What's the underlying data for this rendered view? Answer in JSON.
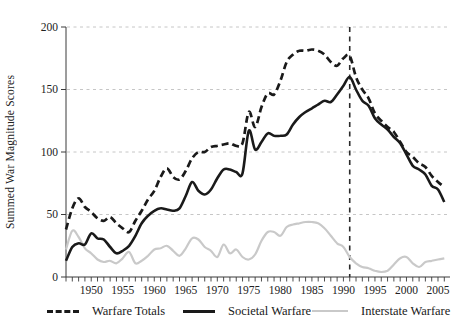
{
  "figure": {
    "ylabel": "Summed War Magnitude Scores"
  },
  "chart_data": {
    "type": "line",
    "title": "",
    "xlabel": "",
    "ylabel": "Summed War Magnitude Scores",
    "xlim": [
      1946,
      2007
    ],
    "ylim": [
      0,
      200
    ],
    "yticks": [
      0,
      50,
      100,
      150,
      200
    ],
    "xticks": [
      1950,
      1955,
      1960,
      1965,
      1970,
      1975,
      1980,
      1985,
      1990,
      1995,
      2000,
      2005
    ],
    "grid": "horizontal-dashed",
    "gridline_values": [
      50,
      100,
      150,
      200
    ],
    "vline_year": 1991,
    "legend_position": "bottom",
    "x": [
      1946,
      1947,
      1948,
      1949,
      1950,
      1951,
      1952,
      1953,
      1954,
      1955,
      1956,
      1957,
      1958,
      1959,
      1960,
      1961,
      1962,
      1963,
      1964,
      1965,
      1966,
      1967,
      1968,
      1969,
      1970,
      1971,
      1972,
      1973,
      1974,
      1975,
      1976,
      1977,
      1978,
      1979,
      1980,
      1981,
      1982,
      1983,
      1984,
      1985,
      1986,
      1987,
      1988,
      1989,
      1990,
      1991,
      1992,
      1993,
      1994,
      1995,
      1996,
      1997,
      1998,
      1999,
      2000,
      2001,
      2002,
      2003,
      2004,
      2005,
      2006
    ],
    "series": [
      {
        "name": "Warfare Totals",
        "color": "#1a1a1a",
        "width": 2.7,
        "dash": "7 4",
        "values": [
          38,
          55,
          63,
          56,
          52,
          47,
          45,
          48,
          43,
          39,
          36,
          45,
          53,
          62,
          69,
          80,
          87,
          80,
          78,
          85,
          95,
          100,
          100,
          104,
          105,
          106,
          107,
          105,
          107,
          132,
          120,
          136,
          147,
          146,
          157,
          172,
          178,
          181,
          181,
          182,
          181,
          178,
          172,
          169,
          175,
          177,
          160,
          150,
          143,
          131,
          125,
          120,
          116,
          108,
          100,
          96,
          91,
          88,
          81,
          76,
          72
        ]
      },
      {
        "name": "Societal Warfare",
        "color": "#1a1a1a",
        "width": 2.6,
        "dash": null,
        "values": [
          13,
          24,
          27,
          26,
          35,
          31,
          30,
          24,
          19,
          21,
          25,
          33,
          43,
          49,
          53,
          55,
          54,
          53,
          55,
          65,
          76,
          69,
          66,
          70,
          79,
          86,
          86,
          84,
          83,
          117,
          102,
          108,
          115,
          113,
          113,
          114,
          122,
          128,
          132,
          135,
          138,
          141,
          140,
          146,
          153,
          160,
          150,
          141,
          137,
          127,
          122,
          118,
          112,
          107,
          98,
          89,
          86,
          82,
          73,
          70,
          60
        ]
      },
      {
        "name": "Interstate Warfare",
        "color": "#c9c9c9",
        "width": 2.2,
        "dash": null,
        "values": [
          22,
          37,
          32,
          23,
          19,
          14,
          12,
          13,
          11,
          15,
          20,
          11,
          13,
          17,
          22,
          23,
          25,
          21,
          17,
          23,
          31,
          30,
          24,
          21,
          16,
          26,
          19,
          22,
          16,
          14,
          18,
          29,
          36,
          36,
          33,
          40,
          42,
          43,
          44,
          44,
          43,
          39,
          33,
          27,
          24,
          16,
          11,
          8,
          7,
          5,
          4,
          5,
          10,
          15,
          16,
          11,
          8,
          12,
          13,
          14,
          15
        ]
      }
    ]
  }
}
